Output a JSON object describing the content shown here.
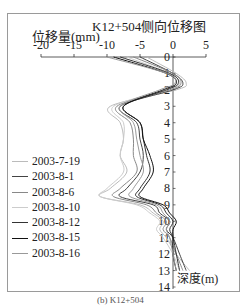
{
  "chart_data": {
    "type": "line",
    "title": "K12+504侧向位移图",
    "xlabel": "位移量(mm)",
    "ylabel": "深度(m)",
    "caption": "(b) K12+504",
    "xlim": [
      -20,
      5
    ],
    "ylim": [
      0,
      14
    ],
    "x_ticks": [
      "-20",
      "-15",
      "-10",
      "-5",
      "0",
      "5"
    ],
    "y_ticks": [
      "0",
      "1",
      "2",
      "3",
      "4",
      "5",
      "6",
      "7",
      "8",
      "9",
      "10",
      "11",
      "12",
      "13",
      "14"
    ],
    "grid": false,
    "legend_position": "left-middle",
    "depth": [
      0,
      1,
      1.6,
      2,
      3,
      4,
      5,
      6,
      7,
      8,
      8.5,
      9,
      9.5,
      10,
      10.5,
      11,
      12,
      13
    ],
    "series": [
      {
        "name": "2003-7-19",
        "color": "#bbbbbb",
        "values": [
          -4,
          0.5,
          2.0,
          0.5,
          -9.5,
          -8,
          -7.5,
          -8,
          -7,
          -9.5,
          -11,
          -5,
          -3,
          -1.5,
          -2,
          -1,
          0.5,
          2.5
        ]
      },
      {
        "name": "2003-8-1",
        "color": "#444444",
        "values": [
          -5,
          0,
          1.5,
          0,
          -8,
          -5.5,
          -5,
          -4.5,
          -5,
          -7,
          -8,
          -3,
          -2,
          -0.5,
          -1,
          0,
          1,
          2
        ]
      },
      {
        "name": "2003-8-6",
        "color": "#888888",
        "values": [
          -6,
          0,
          1.2,
          -0.5,
          -8.5,
          -6.5,
          -6,
          -6,
          -5.5,
          -8,
          -9,
          -4,
          -2.5,
          -1,
          -1.5,
          -0.5,
          0.5,
          1.5
        ]
      },
      {
        "name": "2003-8-10",
        "color": "#cccccc",
        "values": [
          -7,
          -0.5,
          1.0,
          -1,
          -9,
          -7.5,
          -7.5,
          -8,
          -7.5,
          -10,
          -11,
          -5.5,
          -3.5,
          -2,
          -2.5,
          -1.5,
          0,
          1
        ]
      },
      {
        "name": "2003-8-12",
        "color": "#333333",
        "values": [
          -8,
          -0.5,
          0.8,
          -1,
          -7.5,
          -5,
          -4.5,
          -4,
          -3.5,
          -5,
          -5.5,
          -2,
          -1,
          0,
          -0.5,
          0,
          0.5,
          1
        ]
      },
      {
        "name": "2003-8-15",
        "color": "#111111",
        "values": [
          -9,
          -1,
          0.5,
          -1.5,
          -7.5,
          -5,
          -4.5,
          -3.5,
          -3,
          -4.5,
          -5,
          -1.5,
          -0.5,
          0.5,
          0,
          0,
          0,
          0.5
        ]
      },
      {
        "name": "2003-8-16",
        "color": "#999999",
        "values": [
          -10,
          -1,
          0.3,
          -2,
          -8,
          -6,
          -5.5,
          -5,
          -4.5,
          -6,
          -6.5,
          -2.5,
          -1.5,
          -0.5,
          -1,
          -0.5,
          0,
          0.5
        ]
      }
    ]
  },
  "labels": {
    "title": "K12+504侧向位移图",
    "xlabel": "位移量(mm)",
    "ylabel": "深度(m)",
    "caption": "(b) K12+504"
  }
}
